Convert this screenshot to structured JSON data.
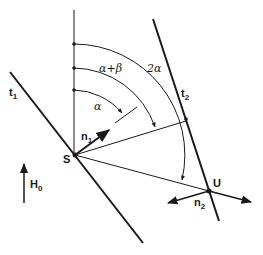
{
  "labels": {
    "t1": "t",
    "t1_sub": "1",
    "t2": "t",
    "t2_sub": "2",
    "S": "S",
    "U": "U",
    "n1": "n",
    "n1_sub": "1",
    "n2": "n",
    "n2_sub": "2",
    "H0": "H",
    "H0_sub": "0",
    "alpha": "α",
    "alpha_plus_beta": "α+β",
    "two_alpha": "2α"
  },
  "colors": {
    "stroke": "#1a1a1a",
    "background": "#ffffff"
  }
}
